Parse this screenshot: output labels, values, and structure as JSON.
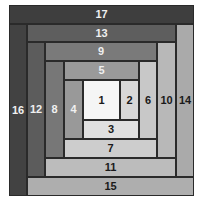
{
  "diagram": {
    "blocks": [
      {
        "label": "1",
        "x": 83,
        "y": 80,
        "w": 37,
        "h": 40,
        "fill": "#f5f5f5",
        "text": "#1a1a1a"
      },
      {
        "label": "2",
        "x": 120,
        "y": 80,
        "w": 19,
        "h": 40,
        "fill": "#d8d8d8",
        "text": "#1a1a1a"
      },
      {
        "label": "3",
        "x": 83,
        "y": 120,
        "w": 56,
        "h": 19,
        "fill": "#e0e0e0",
        "text": "#1a1a1a"
      },
      {
        "label": "4",
        "x": 64,
        "y": 80,
        "w": 19,
        "h": 59,
        "fill": "#999999",
        "text": "#f0f0f0"
      },
      {
        "label": "5",
        "x": 64,
        "y": 61,
        "w": 75,
        "h": 19,
        "fill": "#9a9a9a",
        "text": "#f0f0f0"
      },
      {
        "label": "6",
        "x": 139,
        "y": 61,
        "w": 18,
        "h": 78,
        "fill": "#c8c8c8",
        "text": "#1a1a1a"
      },
      {
        "label": "7",
        "x": 64,
        "y": 139,
        "w": 93,
        "h": 19,
        "fill": "#cdcdcd",
        "text": "#1a1a1a"
      },
      {
        "label": "8",
        "x": 45,
        "y": 61,
        "w": 19,
        "h": 97,
        "fill": "#777777",
        "text": "#f0f0f0"
      },
      {
        "label": "9",
        "x": 45,
        "y": 42,
        "w": 112,
        "h": 19,
        "fill": "#7a7a7a",
        "text": "#f0f0f0"
      },
      {
        "label": "10",
        "x": 157,
        "y": 42,
        "w": 19,
        "h": 116,
        "fill": "#b8b8b8",
        "text": "#1a1a1a"
      },
      {
        "label": "11",
        "x": 45,
        "y": 158,
        "w": 131,
        "h": 19,
        "fill": "#bcbcbc",
        "text": "#1a1a1a"
      },
      {
        "label": "12",
        "x": 27,
        "y": 42,
        "w": 18,
        "h": 135,
        "fill": "#5c5c5c",
        "text": "#f0f0f0"
      },
      {
        "label": "13",
        "x": 27,
        "y": 24,
        "w": 149,
        "h": 18,
        "fill": "#5e5e5e",
        "text": "#f0f0f0"
      },
      {
        "label": "14",
        "x": 176,
        "y": 24,
        "w": 18,
        "h": 153,
        "fill": "#aaaaaa",
        "text": "#1a1a1a"
      },
      {
        "label": "15",
        "x": 27,
        "y": 177,
        "w": 167,
        "h": 19,
        "fill": "#aeaeae",
        "text": "#1a1a1a"
      },
      {
        "label": "16",
        "x": 9,
        "y": 24,
        "w": 18,
        "h": 172,
        "fill": "#424242",
        "text": "#f0f0f0"
      },
      {
        "label": "17",
        "x": 9,
        "y": 5,
        "w": 185,
        "h": 19,
        "fill": "#3e3e3e",
        "text": "#f0f0f0"
      }
    ]
  }
}
